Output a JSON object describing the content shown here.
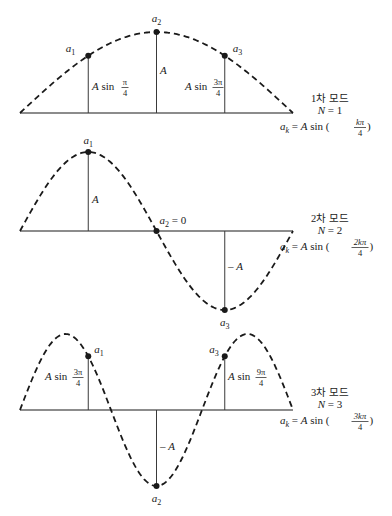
{
  "figure": {
    "modes": [
      {
        "id": "mode-1",
        "title": "1차 모드",
        "n_label": "N = 1",
        "formula": {
          "lhs": "a",
          "lhs_sub": "k",
          "eq": " = A sin (",
          "frac_num": "kπ",
          "frac_den": "4",
          "close": ")"
        },
        "mode_number": 1,
        "points": [
          {
            "name": "a",
            "sub": "1",
            "k": 1
          },
          {
            "name": "a",
            "sub": "2",
            "k": 2
          },
          {
            "name": "a",
            "sub": "3",
            "k": 3
          }
        ],
        "amplitude_labels": [
          {
            "prefix": "A sin ",
            "num": "π",
            "den": "4"
          },
          {
            "prefix": "A",
            "num": "",
            "den": ""
          },
          {
            "prefix": "A sin ",
            "num": "3π",
            "den": "4"
          }
        ]
      },
      {
        "id": "mode-2",
        "title": "2차 모드",
        "n_label": "N = 2",
        "formula": {
          "lhs": "a",
          "lhs_sub": "k",
          "eq": " = A sin (",
          "frac_num": "2kπ",
          "frac_den": "4",
          "close": ")"
        },
        "mode_number": 2,
        "points": [
          {
            "name": "a",
            "sub": "1",
            "k": 1
          },
          {
            "name": "a",
            "sub": "2",
            "k": 2,
            "suffix": " = 0"
          },
          {
            "name": "a",
            "sub": "3",
            "k": 3
          }
        ],
        "amplitude_labels": [
          {
            "prefix": "A",
            "num": "",
            "den": ""
          },
          null,
          {
            "prefix": "– A",
            "num": "",
            "den": ""
          }
        ]
      },
      {
        "id": "mode-3",
        "title": "3차 모드",
        "n_label": "N = 3",
        "formula": {
          "lhs": "a",
          "lhs_sub": "k",
          "eq": " = A sin (",
          "frac_num": "3kπ",
          "frac_den": "4",
          "close": ")"
        },
        "mode_number": 3,
        "points": [
          {
            "name": "a",
            "sub": "1",
            "k": 1
          },
          {
            "name": "a",
            "sub": "2",
            "k": 2
          },
          {
            "name": "a",
            "sub": "3",
            "k": 3
          }
        ],
        "amplitude_labels": [
          {
            "prefix": "A sin ",
            "num": "3π",
            "den": "4"
          },
          {
            "prefix": "– A",
            "num": "",
            "den": ""
          },
          {
            "prefix": "A sin ",
            "num": "9π",
            "den": "4"
          }
        ]
      }
    ],
    "segments": 4,
    "colors": {
      "ink": "#1a1a1a",
      "stem": "#3a3a3a"
    }
  }
}
